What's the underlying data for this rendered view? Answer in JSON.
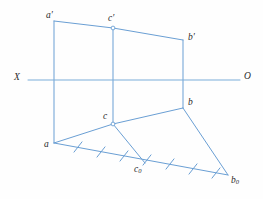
{
  "figure": {
    "type": "descriptive-geometry-projection",
    "width": 263,
    "height": 199,
    "background_color": "#fefefe",
    "line_color": "#6a9fd4",
    "label_color": "#2a2a2a"
  },
  "axis": {
    "name": "XO-projection-axis",
    "left_label": "X",
    "right_label": "O",
    "y": 80,
    "x_start": 28,
    "x_end": 240
  },
  "points": [
    {
      "id": "a-prime",
      "label": "a",
      "prime": true,
      "x": 54,
      "y": 21,
      "label_x": 46,
      "label_y": 11
    },
    {
      "id": "c-prime",
      "label": "c",
      "prime": true,
      "x": 113,
      "y": 28,
      "label_x": 108,
      "label_y": 14,
      "marker": "circle"
    },
    {
      "id": "b-prime",
      "label": "b",
      "prime": true,
      "x": 183,
      "y": 40,
      "label_x": 188,
      "label_y": 33
    },
    {
      "id": "a",
      "label": "a",
      "prime": false,
      "x": 54,
      "y": 143,
      "label_x": 44,
      "label_y": 140
    },
    {
      "id": "c",
      "label": "c",
      "prime": false,
      "x": 113,
      "y": 124,
      "label_x": 103,
      "label_y": 112,
      "marker": "circle"
    },
    {
      "id": "b",
      "label": "b",
      "prime": false,
      "x": 183,
      "y": 108,
      "label_x": 188,
      "label_y": 98
    },
    {
      "id": "c-zero",
      "label": "c",
      "sub": "0",
      "x": 145,
      "y": 163,
      "label_x": 134,
      "label_y": 165
    },
    {
      "id": "b-zero",
      "label": "b",
      "sub": "0",
      "x": 228,
      "y": 175,
      "label_x": 231,
      "label_y": 176
    }
  ],
  "segments": [
    {
      "id": "seg-aprime-cprime",
      "from": [
        54,
        21
      ],
      "to": [
        113,
        28
      ]
    },
    {
      "id": "seg-cprime-bprime",
      "from": [
        113,
        28
      ],
      "to": [
        183,
        40
      ]
    },
    {
      "id": "seg-a-c",
      "from": [
        54,
        143
      ],
      "to": [
        113,
        124
      ]
    },
    {
      "id": "seg-c-b",
      "from": [
        113,
        124
      ],
      "to": [
        183,
        108
      ]
    },
    {
      "id": "seg-vertical-a",
      "from": [
        54,
        21
      ],
      "to": [
        54,
        143
      ]
    },
    {
      "id": "seg-vertical-c",
      "from": [
        113,
        28
      ],
      "to": [
        113,
        124
      ]
    },
    {
      "id": "seg-vertical-b",
      "from": [
        183,
        40
      ],
      "to": [
        183,
        108
      ]
    },
    {
      "id": "seg-c-czero",
      "from": [
        113,
        124
      ],
      "to": [
        145,
        163
      ]
    },
    {
      "id": "seg-b-bzero",
      "from": [
        183,
        108
      ],
      "to": [
        228,
        175
      ]
    },
    {
      "id": "seg-baseline-a-bzero",
      "from": [
        54,
        143
      ],
      "to": [
        228,
        175
      ]
    }
  ],
  "tick_marks": {
    "name": "true-length-division-ticks",
    "count": 7,
    "along_segment": "seg-baseline-a-bzero",
    "positions": [
      {
        "x": 78,
        "y": 147
      },
      {
        "x": 101,
        "y": 152
      },
      {
        "x": 124,
        "y": 156
      },
      {
        "x": 147,
        "y": 160
      },
      {
        "x": 170,
        "y": 164
      },
      {
        "x": 193,
        "y": 169
      },
      {
        "x": 216,
        "y": 173
      }
    ],
    "tick_length": 13,
    "tick_angle_deg": -52
  }
}
